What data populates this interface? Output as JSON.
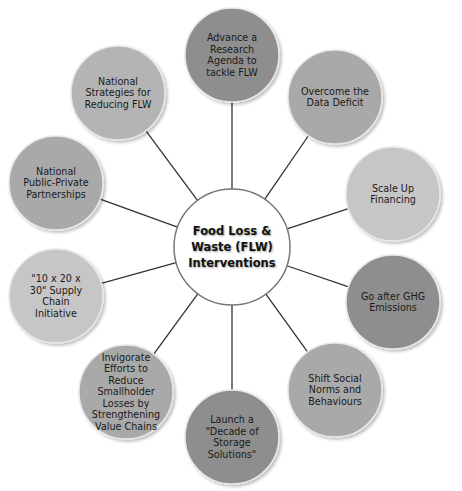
{
  "center": {
    "label": "Food Loss &\nWaste (FLW)\nInterventions",
    "fill": "#ffffff",
    "stroke": "#777777"
  },
  "nodes": [
    {
      "id": "research-agenda",
      "label": "Advance a\nResearch\nAgenda to\ntackle FLW",
      "fill": "#8e8e8e"
    },
    {
      "id": "data-deficit",
      "label": "Overcome the\nData Deficit",
      "fill": "#a9a9a9"
    },
    {
      "id": "scale-up-financing",
      "label": "Scale Up\nFinancing",
      "fill": "#c6c6c6"
    },
    {
      "id": "ghg-emissions",
      "label": "Go after GHG\nEmissions",
      "fill": "#8e8e8e"
    },
    {
      "id": "social-norms",
      "label": "Shift Social\nNorms and\nBehaviours",
      "fill": "#a9a9a9"
    },
    {
      "id": "decade-of-storage",
      "label": "Launch a\n\"Decade of\nStorage\nSolutions\"",
      "fill": "#8e8e8e"
    },
    {
      "id": "smallholder-losses",
      "label": "Invigorate\nEfforts to\nReduce\nSmallholder\nLosses by\nStrengthening\nValue Chains",
      "fill": "#a9a9a9"
    },
    {
      "id": "supply-chain-initiative",
      "label": "\"10 x 20 x\n30\" Supply\nChain\nInitiative",
      "fill": "#c6c6c6"
    },
    {
      "id": "public-private-partnerships",
      "label": "National\nPublic-Private\nPartnerships",
      "fill": "#a9a9a9"
    },
    {
      "id": "national-strategies",
      "label": "National\nStrategies for\nReducing FLW",
      "fill": "#b4b4b4"
    }
  ],
  "connector_color": "#333333"
}
